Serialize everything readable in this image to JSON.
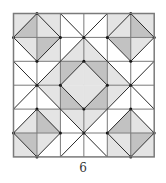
{
  "figure": {
    "caption": "6",
    "grid": {
      "rows": 6,
      "cols": 6,
      "x0": 13.5,
      "y0": 13.5,
      "cell_w": 23.45,
      "cell_h": 23.9
    },
    "colors": {
      "white": "#ffffff",
      "light": "#e4e4e4",
      "medium": "#c2c2c2",
      "line": "#2a2a2a",
      "border": "#7a7a7a"
    },
    "cells": [
      {
        "r": 0,
        "c": 0,
        "diag": "bl-tr",
        "tris": {
          "ul": "light",
          "lr": "medium"
        }
      },
      {
        "r": 0,
        "c": 1,
        "diag": "tl-br",
        "tris": {
          "ur": "light",
          "ll": "light"
        }
      },
      {
        "r": 0,
        "c": 2,
        "diag": "tl-br",
        "tris": {
          "ur": "white",
          "ll": "white"
        }
      },
      {
        "r": 0,
        "c": 3,
        "diag": "bl-tr",
        "tris": {
          "ul": "white",
          "lr": "white"
        }
      },
      {
        "r": 0,
        "c": 4,
        "diag": "bl-tr",
        "tris": {
          "ul": "light",
          "lr": "light"
        }
      },
      {
        "r": 0,
        "c": 5,
        "diag": "tl-br",
        "tris": {
          "ur": "light",
          "ll": "medium"
        }
      },
      {
        "r": 1,
        "c": 0,
        "diag": "tl-br",
        "tris": {
          "ur": "light",
          "ll": "white"
        }
      },
      {
        "r": 1,
        "c": 1,
        "diag": "bl-tr",
        "tris": {
          "ul": "medium",
          "lr": "light"
        }
      },
      {
        "r": 1,
        "c": 2,
        "diag": "bl-tr",
        "tris": {
          "ul": "white",
          "lr": "light"
        }
      },
      {
        "r": 1,
        "c": 3,
        "diag": "tl-br",
        "tris": {
          "ur": "white",
          "ll": "light"
        }
      },
      {
        "r": 1,
        "c": 4,
        "diag": "tl-br",
        "tris": {
          "ur": "medium",
          "ll": "white"
        }
      },
      {
        "r": 1,
        "c": 5,
        "diag": "bl-tr",
        "tris": {
          "ul": "light",
          "lr": "white"
        }
      },
      {
        "r": 2,
        "c": 0,
        "diag": "tl-br",
        "tris": {
          "ur": "white",
          "ll": "white"
        }
      },
      {
        "r": 2,
        "c": 1,
        "diag": "bl-tr",
        "tris": {
          "ul": "white",
          "lr": "light"
        }
      },
      {
        "r": 2,
        "c": 2,
        "diag": "bl-tr",
        "tris": {
          "ul": "medium",
          "lr": "light"
        }
      },
      {
        "r": 2,
        "c": 3,
        "diag": "tl-br",
        "tris": {
          "ur": "medium",
          "ll": "light"
        }
      },
      {
        "r": 2,
        "c": 4,
        "diag": "tl-br",
        "tris": {
          "ur": "white",
          "ll": "light"
        }
      },
      {
        "r": 2,
        "c": 5,
        "diag": "bl-tr",
        "tris": {
          "ul": "white",
          "lr": "white"
        }
      },
      {
        "r": 3,
        "c": 0,
        "diag": "bl-tr",
        "tris": {
          "ul": "white",
          "lr": "white"
        }
      },
      {
        "r": 3,
        "c": 1,
        "diag": "tl-br",
        "tris": {
          "ur": "light",
          "ll": "white"
        }
      },
      {
        "r": 3,
        "c": 2,
        "diag": "tl-br",
        "tris": {
          "ur": "light",
          "ll": "medium"
        }
      },
      {
        "r": 3,
        "c": 3,
        "diag": "bl-tr",
        "tris": {
          "ul": "light",
          "lr": "medium"
        }
      },
      {
        "r": 3,
        "c": 4,
        "diag": "bl-tr",
        "tris": {
          "ul": "light",
          "lr": "white"
        }
      },
      {
        "r": 3,
        "c": 5,
        "diag": "tl-br",
        "tris": {
          "ur": "white",
          "ll": "white"
        }
      },
      {
        "r": 4,
        "c": 0,
        "diag": "bl-tr",
        "tris": {
          "ul": "white",
          "lr": "light"
        }
      },
      {
        "r": 4,
        "c": 1,
        "diag": "tl-br",
        "tris": {
          "ur": "light",
          "ll": "medium"
        }
      },
      {
        "r": 4,
        "c": 2,
        "diag": "tl-br",
        "tris": {
          "ur": "light",
          "ll": "white"
        }
      },
      {
        "r": 4,
        "c": 3,
        "diag": "bl-tr",
        "tris": {
          "ul": "light",
          "lr": "white"
        }
      },
      {
        "r": 4,
        "c": 4,
        "diag": "bl-tr",
        "tris": {
          "ul": "white",
          "lr": "medium"
        }
      },
      {
        "r": 4,
        "c": 5,
        "diag": "tl-br",
        "tris": {
          "ur": "white",
          "ll": "light"
        }
      },
      {
        "r": 5,
        "c": 0,
        "diag": "tl-br",
        "tris": {
          "ur": "medium",
          "ll": "light"
        }
      },
      {
        "r": 5,
        "c": 1,
        "diag": "bl-tr",
        "tris": {
          "ul": "light",
          "lr": "white"
        }
      },
      {
        "r": 5,
        "c": 2,
        "diag": "bl-tr",
        "tris": {
          "ul": "white",
          "lr": "white"
        }
      },
      {
        "r": 5,
        "c": 3,
        "diag": "tl-br",
        "tris": {
          "ur": "white",
          "ll": "white"
        }
      },
      {
        "r": 5,
        "c": 4,
        "diag": "tl-br",
        "tris": {
          "ur": "light",
          "ll": "light"
        }
      },
      {
        "r": 5,
        "c": 5,
        "diag": "bl-tr",
        "tris": {
          "ul": "medium",
          "lr": "light"
        }
      }
    ]
  }
}
